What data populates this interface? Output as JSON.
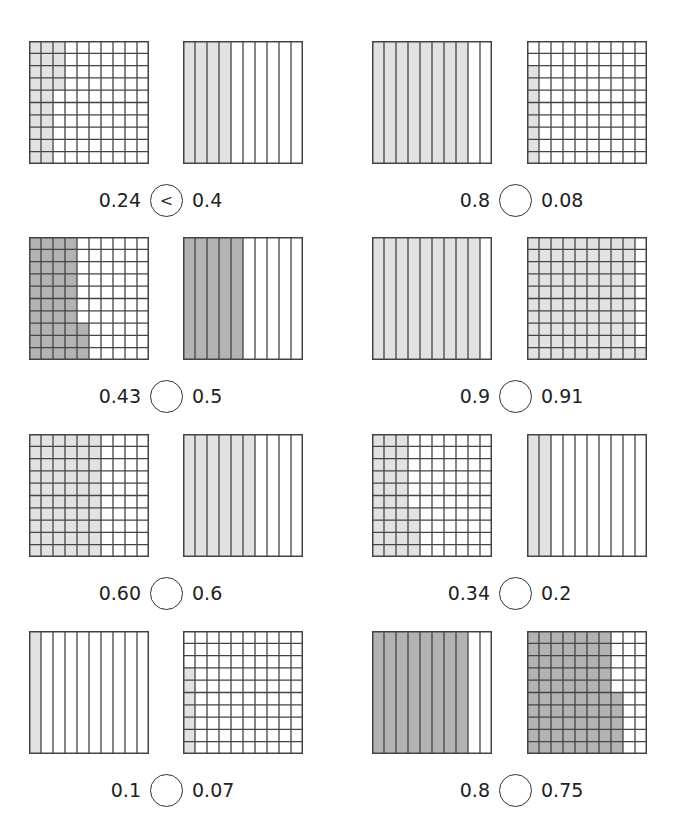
{
  "colors": {
    "light": "#e2e2e2",
    "dark": "#b3b3b3",
    "line": "#444444"
  },
  "problems": [
    {
      "left": {
        "label": "0.24",
        "type": "hundredths",
        "value": 24,
        "shade": "light",
        "fill": "col"
      },
      "right": {
        "label": "0.4",
        "type": "tenths",
        "value": 4,
        "shade": "light"
      },
      "answer": "<"
    },
    {
      "left": {
        "label": "0.8",
        "type": "tenths",
        "value": 8,
        "shade": "light"
      },
      "right": {
        "label": "0.08",
        "type": "hundredths",
        "value": 8,
        "shade": "light"
      },
      "answer": ""
    },
    {
      "left": {
        "label": "0.43",
        "type": "hundredths",
        "value": 43,
        "shade": "dark"
      },
      "right": {
        "label": "0.5",
        "type": "tenths",
        "value": 5,
        "shade": "dark"
      },
      "answer": ""
    },
    {
      "left": {
        "label": "0.9",
        "type": "tenths",
        "value": 9,
        "shade": "light"
      },
      "right": {
        "label": "0.91",
        "type": "hundredths",
        "value": 91,
        "shade": "light"
      },
      "answer": ""
    },
    {
      "left": {
        "label": "0.60",
        "type": "hundredths",
        "value": 60,
        "shade": "light"
      },
      "right": {
        "label": "0.6",
        "type": "tenths",
        "value": 6,
        "shade": "light"
      },
      "answer": ""
    },
    {
      "left": {
        "label": "0.34",
        "type": "hundredths",
        "value": 34,
        "shade": "light"
      },
      "right": {
        "label": "0.2",
        "type": "tenths",
        "value": 2,
        "shade": "light"
      },
      "answer": ""
    },
    {
      "left": {
        "label": "0.1",
        "type": "tenths",
        "value": 1,
        "shade": "light"
      },
      "right": {
        "label": "0.07",
        "type": "hundredths",
        "value": 7,
        "shade": "light"
      },
      "answer": ""
    },
    {
      "left": {
        "label": "0.8",
        "type": "tenths",
        "value": 8,
        "shade": "dark"
      },
      "right": {
        "label": "0.75",
        "type": "hundredths",
        "value": 75,
        "shade": "dark"
      },
      "answer": ""
    }
  ]
}
